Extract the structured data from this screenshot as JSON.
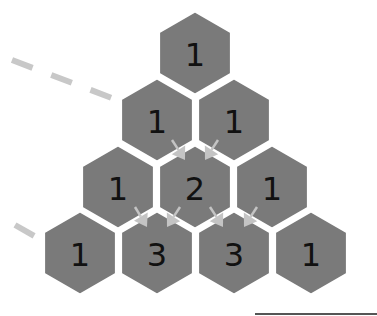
{
  "colors": {
    "hex_fill": "#7a7a7a",
    "hex_stroke": "#ffffff",
    "arrow": "#c4c4c4",
    "dash": "#c8c8c8",
    "text": "#111111",
    "bottom_line": "#555555"
  },
  "rows": [
    {
      "cells": [
        {
          "value": "1",
          "cx": 195,
          "cy": 53
        }
      ]
    },
    {
      "cells": [
        {
          "value": "1",
          "cx": 157,
          "cy": 120
        },
        {
          "value": "1",
          "cx": 234,
          "cy": 120
        }
      ]
    },
    {
      "cells": [
        {
          "value": "1",
          "cx": 118,
          "cy": 187
        },
        {
          "value": "2",
          "cx": 195,
          "cy": 187
        },
        {
          "value": "1",
          "cx": 272,
          "cy": 187
        }
      ]
    },
    {
      "cells": [
        {
          "value": "1",
          "cx": 80,
          "cy": 253
        },
        {
          "value": "3",
          "cx": 157,
          "cy": 253
        },
        {
          "value": "3",
          "cx": 234,
          "cy": 253
        },
        {
          "value": "1",
          "cx": 311,
          "cy": 253
        }
      ]
    }
  ],
  "arrows": [
    {
      "from": [
        172,
        140
      ],
      "to": [
        185,
        160
      ]
    },
    {
      "from": [
        218,
        140
      ],
      "to": [
        205,
        160
      ]
    },
    {
      "from": [
        135,
        207
      ],
      "to": [
        147,
        227
      ]
    },
    {
      "from": [
        180,
        207
      ],
      "to": [
        167,
        227
      ]
    },
    {
      "from": [
        210,
        207
      ],
      "to": [
        223,
        227
      ]
    },
    {
      "from": [
        257,
        207
      ],
      "to": [
        244,
        227
      ]
    }
  ],
  "dashes": [
    {
      "x1": 12,
      "y1": 60,
      "x2": 117,
      "y2": 100
    },
    {
      "x1": 15,
      "y1": 225,
      "x2": 36,
      "y2": 237
    }
  ]
}
